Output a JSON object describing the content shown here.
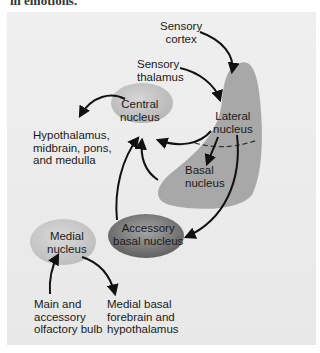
{
  "caption_top": "in emotions.",
  "diagram": {
    "nodes": {
      "sensory_cortex": [
        "Sensory",
        "cortex"
      ],
      "sensory_thalamus": [
        "Sensory",
        "thalamus"
      ],
      "lateral_nucleus": [
        "Lateral",
        "nucleus"
      ],
      "basal_nucleus": [
        "Basal",
        "nucleus"
      ],
      "central_nucleus": [
        "Central",
        "nucleus"
      ],
      "accessory_basal_nucleus": [
        "Accessory",
        "basal nucleus"
      ],
      "medial_nucleus": [
        "Medial",
        "nucleus"
      ],
      "hypothalamus_output": [
        "Hypothalamus,",
        "midbrain, pons,",
        "and medulla"
      ],
      "olfactory_input": [
        "Main and",
        "accessory",
        "olfactory bulb"
      ],
      "medial_basal_output": [
        "Medial basal",
        "forebrain and",
        "hypothalamus"
      ]
    },
    "edges": [
      {
        "from": "Sensory cortex",
        "to": "Lateral nucleus"
      },
      {
        "from": "Sensory thalamus",
        "to": "Lateral nucleus"
      },
      {
        "from": "Lateral nucleus",
        "to": "Basal nucleus"
      },
      {
        "from": "Lateral nucleus",
        "to": "Central nucleus"
      },
      {
        "from": "Lateral nucleus",
        "to": "Accessory basal nucleus"
      },
      {
        "from": "Basal nucleus",
        "to": "Central nucleus"
      },
      {
        "from": "Accessory basal nucleus",
        "to": "Central nucleus"
      },
      {
        "from": "Central nucleus",
        "to": "Hypothalamus, midbrain, pons, and medulla"
      },
      {
        "from": "Main and accessory olfactory bulb",
        "to": "Medial nucleus"
      },
      {
        "from": "Medial nucleus",
        "to": "Medial basal forebrain and hypothalamus"
      }
    ],
    "colors": {
      "background": "#ececec",
      "amygdala_region": "#a9a9a9",
      "central_nucleus": "#c4c4c4",
      "medial_nucleus": "#cbcbcb",
      "accessory_basal_nucleus": "#7a7a7a",
      "arrows": "#111111"
    }
  }
}
